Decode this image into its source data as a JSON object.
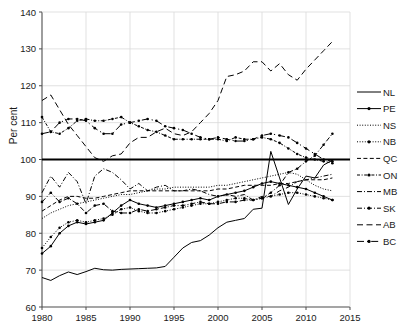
{
  "figure": {
    "background": "#ffffff",
    "ylabel": "Per cent",
    "line_color": "#000000",
    "grid_color": "#d9d9d9",
    "axis_color": "#4d4d4d",
    "reference_line_value": 100
  },
  "chart_data": {
    "type": "line",
    "title": "",
    "xlabel": "",
    "ylabel": "Per cent",
    "xlim": [
      1980,
      2015
    ],
    "ylim": [
      60,
      140
    ],
    "xticks": [
      1980,
      1985,
      1990,
      1995,
      2000,
      2005,
      2010,
      2015
    ],
    "yticks": [
      60,
      70,
      80,
      90,
      100,
      110,
      120,
      130,
      140
    ],
    "grid": true,
    "legend_position": "right",
    "reference_lines": [
      100
    ],
    "x": [
      1980,
      1981,
      1982,
      1983,
      1984,
      1985,
      1986,
      1987,
      1988,
      1989,
      1990,
      1991,
      1992,
      1993,
      1994,
      1995,
      1996,
      1997,
      1998,
      1999,
      2000,
      2001,
      2002,
      2003,
      2004,
      2005,
      2006,
      2007,
      2008,
      2009,
      2010,
      2011,
      2012,
      2013
    ],
    "series": [
      {
        "name": "NL",
        "label": "NL",
        "style": "solid",
        "marker": "none",
        "values": [
          68.0,
          67.2,
          68.5,
          69.5,
          68.8,
          69.6,
          70.5,
          70.1,
          70.0,
          70.2,
          70.3,
          70.4,
          70.5,
          70.6,
          71.0,
          73.5,
          76.0,
          77.5,
          78.0,
          79.5,
          81.5,
          83.0,
          83.5,
          84.0,
          86.5,
          86.8,
          102.2,
          95.0,
          87.8,
          92.0,
          95.5,
          95.0,
          98.5,
          99.8
        ]
      },
      {
        "name": "PE",
        "label": "PE",
        "style": "solid",
        "marker": "dot",
        "values": [
          74.5,
          76.5,
          80.0,
          82.0,
          83.0,
          82.5,
          83.0,
          83.5,
          85.5,
          87.5,
          89.0,
          88.0,
          87.5,
          87.0,
          87.5,
          88.0,
          88.5,
          89.0,
          89.5,
          89.0,
          90.0,
          90.5,
          91.0,
          91.5,
          92.5,
          93.5,
          94.0,
          93.5,
          93.0,
          92.5,
          92.0,
          91.0,
          90.0,
          89.0
        ]
      },
      {
        "name": "NS",
        "label": "NS",
        "style": "dotted",
        "marker": "none",
        "values": [
          84.0,
          85.5,
          86.5,
          87.5,
          88.0,
          88.5,
          89.0,
          89.5,
          90.0,
          90.5,
          90.5,
          91.0,
          91.5,
          92.0,
          92.0,
          92.5,
          92.5,
          92.5,
          92.5,
          92.5,
          93.0,
          93.0,
          93.5,
          94.0,
          94.5,
          95.0,
          95.5,
          96.0,
          96.5,
          96.0,
          94.5,
          93.0,
          92.0,
          91.5
        ]
      },
      {
        "name": "NB",
        "label": "NB",
        "style": "dotted",
        "marker": "dot",
        "values": [
          76.0,
          79.0,
          81.5,
          83.0,
          83.5,
          83.0,
          83.5,
          84.0,
          85.0,
          86.5,
          87.0,
          86.0,
          85.5,
          85.5,
          86.0,
          86.5,
          87.0,
          87.5,
          88.0,
          88.0,
          88.5,
          89.0,
          89.5,
          89.5,
          89.0,
          89.5,
          90.0,
          90.5,
          91.0,
          91.0,
          90.5,
          90.0,
          89.5,
          89.0
        ]
      },
      {
        "name": "QC",
        "label": "QC",
        "style": "dashed",
        "marker": "none",
        "values": [
          86.0,
          87.5,
          89.0,
          90.0,
          90.0,
          89.5,
          89.5,
          90.0,
          90.5,
          91.0,
          91.5,
          91.5,
          91.5,
          91.5,
          91.5,
          91.5,
          91.5,
          91.5,
          91.5,
          91.5,
          92.0,
          92.0,
          92.5,
          93.0,
          93.0,
          93.0,
          93.0,
          93.5,
          93.5,
          94.0,
          94.5,
          94.5,
          94.5,
          95.0
        ]
      },
      {
        "name": "ON",
        "label": "ON",
        "style": "dashdot-dense",
        "marker": "dot",
        "values": [
          111.5,
          107.5,
          107.0,
          108.5,
          110.5,
          111.0,
          110.5,
          110.5,
          111.0,
          111.5,
          110.0,
          109.0,
          108.0,
          107.5,
          106.5,
          105.5,
          105.5,
          105.5,
          105.5,
          105.5,
          105.5,
          105.0,
          106.0,
          105.5,
          105.5,
          106.0,
          105.5,
          104.5,
          103.0,
          101.5,
          100.5,
          100.0,
          99.5,
          99.0
        ]
      },
      {
        "name": "MB",
        "label": "MB",
        "style": "dashdot",
        "marker": "none",
        "values": [
          91.0,
          95.5,
          92.5,
          96.5,
          94.0,
          88.0,
          95.5,
          97.5,
          96.5,
          94.5,
          92.0,
          93.5,
          91.5,
          92.5,
          93.0,
          91.5,
          91.5,
          92.0,
          91.5,
          90.5,
          90.0,
          90.5,
          90.0,
          90.5,
          89.0,
          90.0,
          90.0,
          91.5,
          92.5,
          94.0,
          94.5,
          95.0,
          95.5,
          96.0
        ]
      },
      {
        "name": "SK",
        "label": "SK",
        "style": "dashdot",
        "marker": "dot",
        "values": [
          88.5,
          91.0,
          88.5,
          89.5,
          88.0,
          85.5,
          87.5,
          88.0,
          86.0,
          85.5,
          85.5,
          86.5,
          86.0,
          86.5,
          87.0,
          87.5,
          87.5,
          88.0,
          88.5,
          88.0,
          88.0,
          88.5,
          88.5,
          89.0,
          89.0,
          89.5,
          91.0,
          93.0,
          96.5,
          97.5,
          99.5,
          101.0,
          104.0,
          107.0
        ]
      },
      {
        "name": "AB",
        "label": "AB",
        "style": "dashed-long",
        "marker": "none",
        "values": [
          116.0,
          117.5,
          113.5,
          109.5,
          106.5,
          103.5,
          100.5,
          99.5,
          101.0,
          101.5,
          104.5,
          106.0,
          106.0,
          107.5,
          108.5,
          107.0,
          106.5,
          107.5,
          110.0,
          112.5,
          116.0,
          122.5,
          123.0,
          124.0,
          126.5,
          126.5,
          124.0,
          126.0,
          123.0,
          121.5,
          124.5,
          127.0,
          129.5,
          132.0
        ]
      },
      {
        "name": "BC",
        "label": "BC",
        "style": "dashdot-long",
        "marker": "dot",
        "values": [
          107.0,
          107.5,
          110.0,
          111.0,
          111.0,
          110.5,
          108.5,
          107.0,
          107.0,
          109.5,
          110.0,
          110.5,
          111.0,
          110.5,
          109.0,
          108.5,
          108.0,
          107.0,
          106.0,
          105.5,
          106.0,
          105.5,
          105.0,
          105.0,
          105.5,
          106.5,
          107.0,
          106.5,
          106.0,
          104.5,
          103.0,
          101.5,
          100.0,
          99.5
        ]
      }
    ]
  },
  "legend": {
    "entries": [
      {
        "label": "NL",
        "style": "solid",
        "marker": "none"
      },
      {
        "label": "PE",
        "style": "solid",
        "marker": "dot"
      },
      {
        "label": "NS",
        "style": "dotted",
        "marker": "none"
      },
      {
        "label": "NB",
        "style": "dotted",
        "marker": "dot"
      },
      {
        "label": "QC",
        "style": "dashed",
        "marker": "none"
      },
      {
        "label": "ON",
        "style": "dashdot-dense",
        "marker": "dot"
      },
      {
        "label": "MB",
        "style": "dashdot",
        "marker": "none"
      },
      {
        "label": "SK",
        "style": "dashdot",
        "marker": "dot"
      },
      {
        "label": "AB",
        "style": "dashed-long",
        "marker": "none"
      },
      {
        "label": "BC",
        "style": "dashdot-long",
        "marker": "dot"
      }
    ]
  }
}
